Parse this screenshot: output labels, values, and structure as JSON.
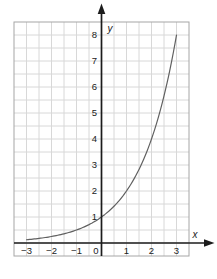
{
  "figure": {
    "background": "#ffffff"
  },
  "chart_data": {
    "type": "line",
    "title": "",
    "function": "y = 2^x",
    "curve": {
      "base": 2,
      "x_min": -3,
      "x_max": 3
    },
    "key_points": [
      [
        -3,
        0.125
      ],
      [
        -2,
        0.25
      ],
      [
        -1,
        0.5
      ],
      [
        0,
        1
      ],
      [
        1,
        2
      ],
      [
        2,
        4
      ],
      [
        3,
        8
      ]
    ],
    "xlabel": "x",
    "ylabel": "y",
    "xlim": [
      -3.5,
      3.5
    ],
    "ylim": [
      -0.5,
      8.5
    ],
    "x_ticks": [
      {
        "value": -3,
        "label": "−3"
      },
      {
        "value": -2,
        "label": "−2"
      },
      {
        "value": -1,
        "label": "−1"
      },
      {
        "value": 0,
        "label": "0"
      },
      {
        "value": 1,
        "label": "1"
      },
      {
        "value": 2,
        "label": "2"
      },
      {
        "value": 3,
        "label": "3"
      }
    ],
    "y_ticks": [
      {
        "value": 1,
        "label": "1"
      },
      {
        "value": 2,
        "label": "2"
      },
      {
        "value": 3,
        "label": "3"
      },
      {
        "value": 4,
        "label": "4"
      },
      {
        "value": 5,
        "label": "5"
      },
      {
        "value": 6,
        "label": "6"
      },
      {
        "value": 7,
        "label": "7"
      },
      {
        "value": 8,
        "label": "8"
      }
    ],
    "grid": {
      "visible": true,
      "step": 0.5
    },
    "legend": {
      "visible": false
    },
    "colors": {
      "background": "#ffffff",
      "grid": "#d8d8d8",
      "frame": "#a6a6a6",
      "axis": "#1c1c1c",
      "curve": "#606060",
      "text": "#222222"
    }
  }
}
